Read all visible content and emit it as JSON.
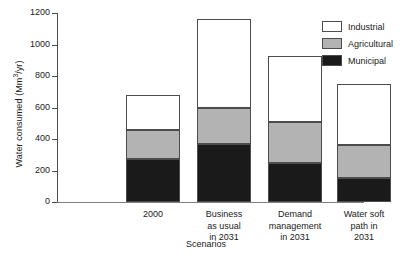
{
  "chart_data": {
    "type": "bar",
    "subtype": "stacked-bar-vertical",
    "title": "",
    "xlabel": "Scenarios",
    "ylabel": "Water consumed (Mm3/yr)",
    "ylabel_rich": {
      "prefix": "Water consumed (Mm",
      "superscript": "3",
      "suffix": "/yr)"
    },
    "categories": [
      "2000",
      "Business\nas usual\nin 2031",
      "Demand\nmanagement\nin 2031",
      "Water soft\npath in\n2031"
    ],
    "series": [
      {
        "name": "Municipal",
        "color": "#1a1a1a",
        "values": [
          270,
          370,
          245,
          155
        ]
      },
      {
        "name": "Agricultural",
        "color": "#b3b3b3",
        "values": [
          185,
          230,
          260,
          210
        ]
      },
      {
        "name": "Industrial",
        "color": "#ffffff",
        "values": [
          225,
          565,
          425,
          385
        ]
      }
    ],
    "totals": [
      680,
      1165,
      930,
      750
    ],
    "ylim": [
      0,
      1200
    ],
    "yticks": [
      0,
      200,
      400,
      600,
      800,
      1000,
      1200
    ],
    "ytick_labels": [
      "0",
      "200",
      "400",
      "600",
      "800",
      "1000",
      "1200"
    ],
    "grid": false,
    "legend": {
      "position": "top-right",
      "entries": [
        {
          "label": "Industrial",
          "color": "#ffffff"
        },
        {
          "label": "Agricultural",
          "color": "#b3b3b3"
        },
        {
          "label": "Municipal",
          "color": "#1a1a1a"
        }
      ]
    },
    "axis_color": "#4c4c4c",
    "background": "#ffffff"
  }
}
